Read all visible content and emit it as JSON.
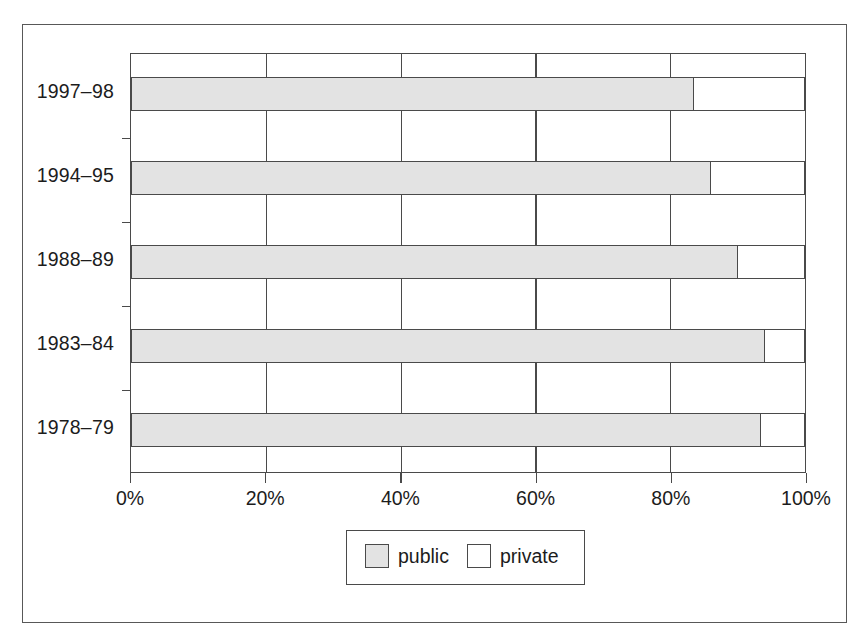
{
  "chart_data": {
    "type": "bar",
    "orientation": "horizontal",
    "stacked": true,
    "stacked_mode": "percent",
    "title": "",
    "xlabel": "",
    "ylabel": "",
    "xlim": [
      0,
      100
    ],
    "grid": true,
    "legend_position": "bottom",
    "categories": [
      "1997–98",
      "1994–95",
      "1988–89",
      "1983–84",
      "1978–79"
    ],
    "xtick_labels": [
      "0%",
      "20%",
      "40%",
      "60%",
      "80%",
      "100%"
    ],
    "xtick_values": [
      0,
      20,
      40,
      60,
      80,
      100
    ],
    "series": [
      {
        "name": "public",
        "color": "#e3e3e3",
        "values": [
          83.5,
          86.0,
          90.0,
          94.0,
          93.5
        ]
      },
      {
        "name": "private",
        "color": "#ffffff",
        "values": [
          16.5,
          14.0,
          10.0,
          6.0,
          6.5
        ]
      }
    ],
    "rows": [
      {
        "category": "1997–98",
        "public": 83.5,
        "private": 16.5
      },
      {
        "category": "1994–95",
        "public": 86.0,
        "private": 14.0
      },
      {
        "category": "1988–89",
        "public": 90.0,
        "private": 10.0
      },
      {
        "category": "1983–84",
        "public": 94.0,
        "private": 6.0
      },
      {
        "category": "1978–79",
        "public": 93.5,
        "private": 6.5
      }
    ]
  },
  "legend": {
    "items": [
      {
        "label": "public",
        "color": "#e3e3e3"
      },
      {
        "label": "private",
        "color": "#ffffff"
      }
    ]
  },
  "colors": {
    "public_fill": "#e3e3e3",
    "private_fill": "#ffffff",
    "line": "#4a4a4a",
    "frame": "#585858",
    "text": "#1c1c1c",
    "background": "#ffffff"
  }
}
